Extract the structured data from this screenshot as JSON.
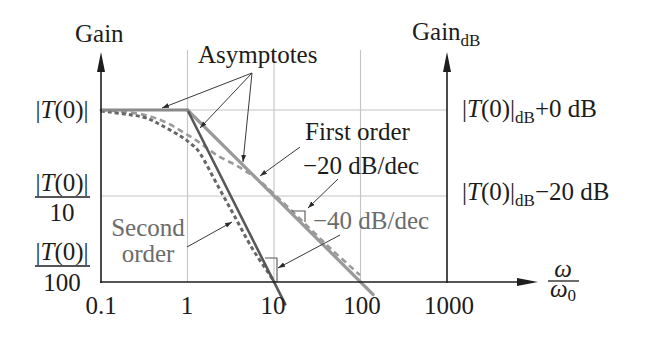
{
  "y_axis_left": {
    "title": "Gain",
    "ticks": [
      {
        "open": "|",
        "var": "T",
        "close": "(0)|",
        "den": ""
      },
      {
        "open": "|",
        "var": "T",
        "close": "(0)|",
        "den": "10"
      },
      {
        "open": "|",
        "var": "T",
        "close": "(0)|",
        "den": "100"
      }
    ]
  },
  "y_axis_right": {
    "title": "Gain",
    "title_sub": "dB",
    "ticks": [
      {
        "open": "|",
        "var": "T",
        "close": "(0)|",
        "sub": "dB",
        "suffix": "+0 dB"
      },
      {
        "open": "|",
        "var": "T",
        "close": "(0)|",
        "sub": "dB",
        "suffix": "−20 dB"
      }
    ]
  },
  "x_axis": {
    "ticks": [
      "0.1",
      "1",
      "10",
      "100",
      "1000"
    ],
    "title": {
      "num": "ω",
      "den": "ω",
      "den_sub": "0"
    }
  },
  "annotations": {
    "asymptotes": "Asymptotes",
    "first_order": "First order",
    "first_slope": "−20 dB/dec",
    "second_order": [
      "Second",
      "order"
    ],
    "second_slope": "−40 dB/dec"
  },
  "colors": {
    "axis": "#1e1e1e",
    "grid": "#c4c4c4",
    "first_order_line": "#9a9a9a",
    "second_order_line": "#585858",
    "gray_text": "#6b6b6b"
  },
  "chart_data": {
    "type": "line",
    "title": "",
    "xlabel": "ω/ω0",
    "ylabel_left": "Gain",
    "ylabel_right": "Gain_dB",
    "xscale": "log",
    "y_units": "dB relative to |T(0)|",
    "xlim": [
      0.1,
      1000
    ],
    "ylim_db": [
      -40,
      0
    ],
    "x_ticks": [
      0.1,
      1,
      10,
      100,
      1000
    ],
    "y_ticks_left": [
      "|T(0)|",
      "|T(0)|/10",
      "|T(0)|/100"
    ],
    "y_ticks_right": [
      "|T(0)|dB+0 dB",
      "|T(0)|dB−20 dB"
    ],
    "grid": true,
    "grid_x": [
      1,
      10,
      100
    ],
    "grid_y_db": [
      0,
      -20
    ],
    "legend": null,
    "series": [
      {
        "name": "Asymptote (flat, |T(0)|)",
        "style": "solid",
        "points": [
          [
            0.1,
            0
          ],
          [
            1,
            0
          ]
        ]
      },
      {
        "name": "First order asymptote (−20 dB/dec)",
        "style": "solid",
        "points": [
          [
            1,
            0
          ],
          [
            140,
            -42.9
          ]
        ]
      },
      {
        "name": "Second order asymptote (−40 dB/dec)",
        "style": "solid",
        "points": [
          [
            1,
            0
          ],
          [
            13.5,
            -45.2
          ]
        ]
      },
      {
        "name": "First order actual response",
        "style": "dashed",
        "points": [
          [
            0.1,
            0
          ],
          [
            0.28,
            -0.9
          ],
          [
            0.55,
            -2.8
          ],
          [
            1,
            -5.8
          ],
          [
            1.41,
            -7.7
          ],
          [
            2.19,
            -10.5
          ],
          [
            3.73,
            -13.0
          ],
          [
            6.35,
            -16.0
          ],
          [
            10.3,
            -19.8
          ],
          [
            19.9,
            -25.3
          ],
          [
            44.4,
            -32.1
          ],
          [
            98.6,
            -38.4
          ]
        ]
      },
      {
        "name": "Second order actual response",
        "style": "dashed",
        "points": [
          [
            0.1,
            -0.2
          ],
          [
            0.3,
            -1.6
          ],
          [
            0.49,
            -3.5
          ],
          [
            0.82,
            -6.0
          ],
          [
            1.07,
            -7.7
          ],
          [
            1.41,
            -10.2
          ],
          [
            2.25,
            -17.7
          ],
          [
            3.54,
            -24.9
          ],
          [
            5.57,
            -32.1
          ],
          [
            7.87,
            -36.7
          ],
          [
            10.3,
            -40.2
          ]
        ]
      }
    ],
    "annotations": [
      "Asymptotes",
      "First order −20 dB/dec",
      "Second order −40 dB/dec"
    ]
  }
}
